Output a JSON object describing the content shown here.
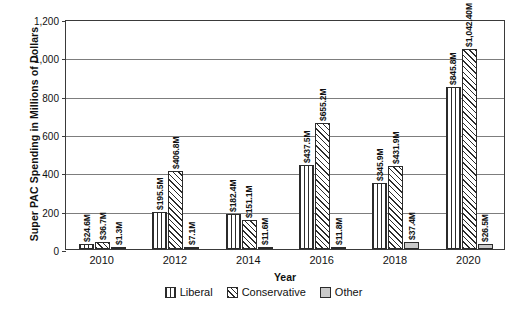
{
  "chart_data": {
    "type": "bar",
    "title": "",
    "xlabel": "Year",
    "ylabel": "Super PAC Spending in Millions of Dollars",
    "categories": [
      "2010",
      "2012",
      "2014",
      "2016",
      "2018",
      "2020"
    ],
    "ylim": [
      0,
      1200
    ],
    "yticks": [
      0,
      200,
      400,
      600,
      800,
      1000,
      1200
    ],
    "ytick_labels": [
      "0",
      "200",
      "400",
      "600",
      "800",
      "1,000",
      "1,200"
    ],
    "grid": true,
    "legend_position": "bottom",
    "series": [
      {
        "name": "Liberal",
        "pattern": "vertical-lines",
        "values": [
          24.6,
          195.5,
          182.4,
          437.5,
          345.9,
          845.8
        ],
        "labels": [
          "$24.6M",
          "$195.5M",
          "$182.4M",
          "$437.5M",
          "$345.9M",
          "$845.8M"
        ]
      },
      {
        "name": "Conservative",
        "pattern": "diagonal-hatch",
        "values": [
          36.7,
          406.8,
          151.1,
          655.2,
          431.9,
          1042.4
        ],
        "labels": [
          "$36.7M",
          "$406.8M",
          "$151.1M",
          "$655.2M",
          "$431.9M",
          "$1,042.40M"
        ]
      },
      {
        "name": "Other",
        "pattern": "solid-gray",
        "values": [
          1.3,
          7.1,
          11.6,
          11.8,
          37.4,
          26.5
        ],
        "labels": [
          "$1.3M",
          "$7.1M",
          "$11.6M",
          "$11.8M",
          "$37.4M",
          "$26.5M"
        ]
      }
    ]
  },
  "colors": {
    "axis": "#3a3a3a",
    "gridline": "#7d7d7d",
    "bar_outline": "#2b2b2b",
    "other_fill": "#c9c9c9",
    "background": "#ffffff"
  }
}
